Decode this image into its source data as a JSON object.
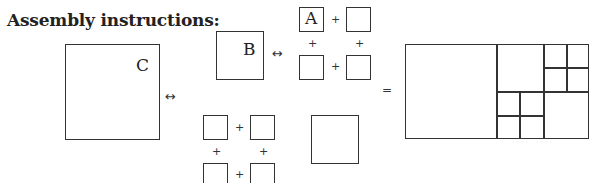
{
  "title": "Assembly instructions:",
  "labels": {
    "c": "C",
    "b": "B",
    "a": "A"
  },
  "symbols": {
    "arrow": "↔",
    "plus": "+",
    "equals": "="
  }
}
